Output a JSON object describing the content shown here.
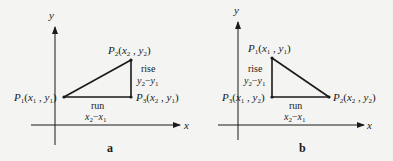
{
  "diagrams": [
    {
      "id": "a",
      "panel_label": "a",
      "axes": {
        "x_label": "x",
        "y_label": "y"
      },
      "points": {
        "p1": {
          "name": "P",
          "sub": "1",
          "coords": "(x1, y1)"
        },
        "p2": {
          "name": "P",
          "sub": "2",
          "coords": "(x2, y2)"
        },
        "p3": {
          "name": "P",
          "sub": "3",
          "coords": "(x2, y1)"
        }
      },
      "rise": {
        "label": "rise",
        "expr": "y2−y1"
      },
      "run": {
        "label": "run",
        "expr": "x2−x1"
      }
    },
    {
      "id": "b",
      "panel_label": "b",
      "axes": {
        "x_label": "x",
        "y_label": "y"
      },
      "points": {
        "p1": {
          "name": "P",
          "sub": "1",
          "coords": "(x1, y1)"
        },
        "p2": {
          "name": "P",
          "sub": "2",
          "coords": "(x2, y2)"
        },
        "p3": {
          "name": "P",
          "sub": "3",
          "coords": "(x1, y2)"
        }
      },
      "rise": {
        "label": "rise",
        "expr": "y2−y1"
      },
      "run": {
        "label": "run",
        "expr": "x2−x1"
      }
    }
  ],
  "colors": {
    "ink": "#1a1a1a",
    "background": "#f4f4f2"
  }
}
